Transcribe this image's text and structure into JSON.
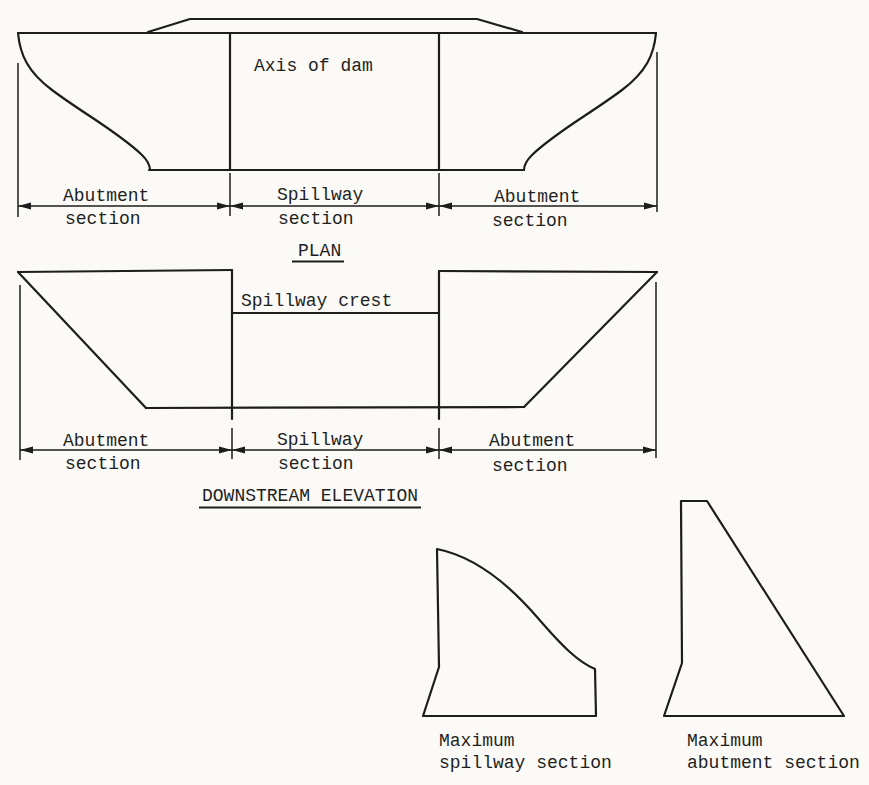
{
  "figure": {
    "paper_color": "#fbfaf7",
    "ink_color": "#1d1d1d"
  },
  "plan": {
    "axis_label": "Axis of dam",
    "title": "PLAN",
    "dimensions": [
      {
        "line1": "Abutment",
        "line2": "section"
      },
      {
        "line1": "Spillway",
        "line2": "section"
      },
      {
        "line1": "Abutment",
        "line2": "section"
      }
    ]
  },
  "elevation": {
    "crest_label": "Spillway crest",
    "title": "DOWNSTREAM ELEVATION",
    "dimensions": [
      {
        "line1": "Abutment",
        "line2": "section"
      },
      {
        "line1": "Spillway",
        "line2": "section"
      },
      {
        "line1": "Abutment",
        "line2": "section"
      }
    ]
  },
  "cross_sections": {
    "spillway": {
      "line1": "Maximum",
      "line2": "spillway section"
    },
    "abutment": {
      "line1": "Maximum",
      "line2": "abutment section"
    }
  }
}
